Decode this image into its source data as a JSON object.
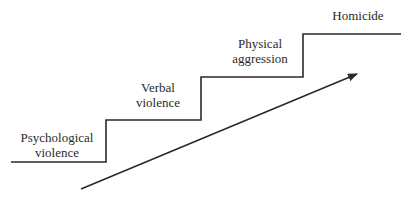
{
  "diagram": {
    "type": "staircase-escalation",
    "steps": [
      {
        "line1": "Psychological",
        "line2": "violence"
      },
      {
        "line1": "Verbal",
        "line2": "violence"
      },
      {
        "line1": "Physical",
        "line2": "aggression"
      },
      {
        "line1": "Homicide",
        "line2": ""
      }
    ],
    "arrow": {
      "direction": "up-right",
      "meaning": "escalation"
    },
    "colors": {
      "line": "#2a2a2a",
      "background": "#ffffff"
    }
  }
}
